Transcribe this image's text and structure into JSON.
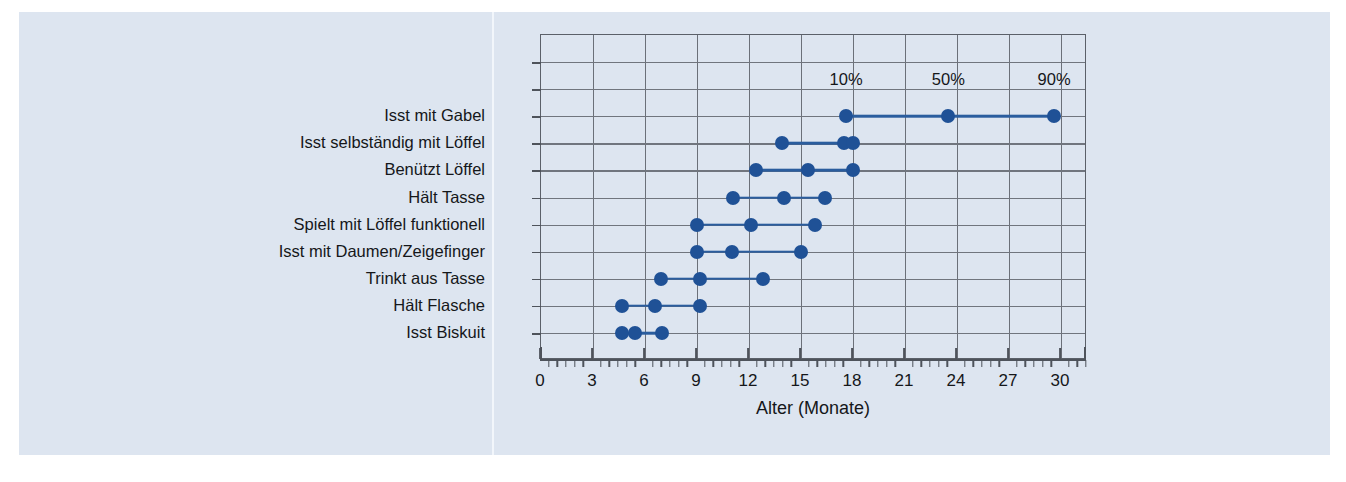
{
  "chart_data": {
    "type": "scatter",
    "title": "",
    "subtitle": "",
    "xlabel": "Alter (Monate)",
    "ylabel": "",
    "xlim": [
      0,
      31.5
    ],
    "xticks": [
      0,
      3,
      6,
      9,
      12,
      15,
      18,
      21,
      24,
      27,
      30
    ],
    "xtick_labels": [
      "0",
      "3",
      "6",
      "9",
      "12",
      "15",
      "18",
      "21",
      "24",
      "27",
      "30"
    ],
    "minor_tick_step": 0.5,
    "grid": true,
    "legend_position": "inside-top",
    "percentile_labels": [
      "10%",
      "50%",
      "90%"
    ],
    "percentile_label_x": [
      17.6,
      23.5,
      29.6
    ],
    "categories": [
      "Isst mit Gabel",
      "Isst selbständig mit Löffel",
      "Benützt Löffel",
      "Hält Tasse",
      "Spielt mit Löffel funktionell",
      "Isst mit Daumen/Zeigefinger",
      "Trinkt aus Tasse",
      "Hält Flasche",
      "Isst Biskuit"
    ],
    "series": [
      {
        "name": "10%",
        "values": [
          17.6,
          13.9,
          12.4,
          11.1,
          9.0,
          9.0,
          6.9,
          4.7,
          4.7
        ]
      },
      {
        "name": "50%",
        "values": [
          23.5,
          17.5,
          15.4,
          14.0,
          12.1,
          11.0,
          9.2,
          6.6,
          5.4
        ]
      },
      {
        "name": "90%",
        "values": [
          29.6,
          18.0,
          18.0,
          16.4,
          15.8,
          15.0,
          12.8,
          9.2,
          7.0
        ]
      }
    ],
    "rows": [
      {
        "label": "Isst mit Gabel",
        "p10": 17.6,
        "p50": 23.5,
        "p90": 29.6
      },
      {
        "label": "Isst selbständig mit Löffel",
        "p10": 13.9,
        "p50": 17.5,
        "p90": 18.0
      },
      {
        "label": "Benützt Löffel",
        "p10": 12.4,
        "p50": 15.4,
        "p90": 18.0
      },
      {
        "label": "Hält Tasse",
        "p10": 11.1,
        "p50": 14.0,
        "p90": 16.4
      },
      {
        "label": "Spielt mit Löffel funktionell",
        "p10": 9.0,
        "p50": 12.1,
        "p90": 15.8
      },
      {
        "label": "Isst mit Daumen/Zeigefinger",
        "p10": 9.0,
        "p50": 11.0,
        "p90": 15.0
      },
      {
        "label": "Trinkt aus Tasse",
        "p10": 6.9,
        "p50": 9.2,
        "p90": 12.8
      },
      {
        "label": "Hält Flasche",
        "p10": 4.7,
        "p50": 6.6,
        "p90": 9.2
      },
      {
        "label": "Isst Biskuit",
        "p10": 4.7,
        "p50": 5.4,
        "p90": 7.0
      }
    ],
    "colors": {
      "marker": "#1f5196",
      "line": "#2a5d9e",
      "grid": "#70757e",
      "axis": "#4e535b",
      "panel_background": "#dde5f0",
      "page_background": "#ffffff",
      "text": "#15171a"
    }
  }
}
